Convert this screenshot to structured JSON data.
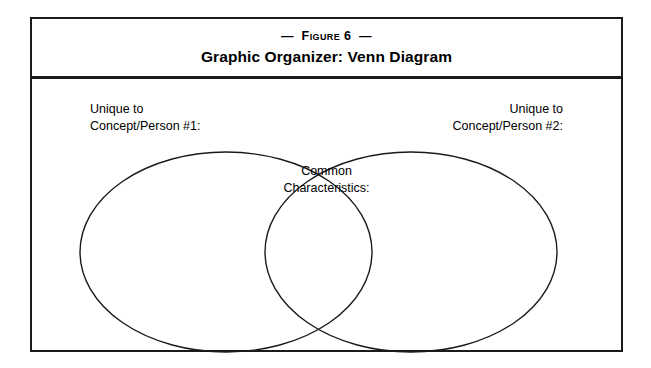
{
  "figure": {
    "number_line": "—  Figure 6  —",
    "subtitle": "Graphic Organizer: Venn Diagram"
  },
  "organizer": {
    "left_label": "Unique to\nConcept/Person #1:",
    "right_label": "Unique to\nConcept/Person #2:",
    "center_label": "Common\nCharacteristics:"
  },
  "style": {
    "ink": "#1a1a1a",
    "page_background": "#ffffff"
  }
}
